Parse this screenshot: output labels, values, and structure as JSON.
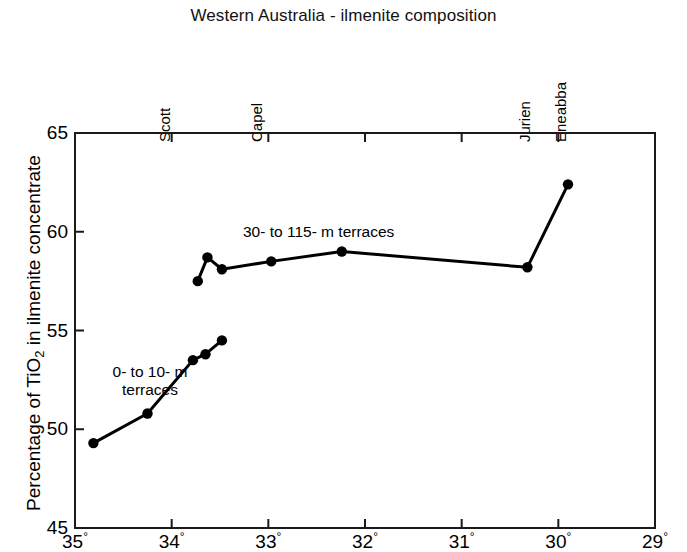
{
  "chart_data": {
    "type": "line",
    "title": "Western Australia - ilmenite composition",
    "xlabel": "",
    "ylabel": "Percentage of TiO2 in ilmenite concentrate",
    "ylabel_parts": {
      "pre": "Percentage of TiO",
      "sub": "2",
      "post": " in ilmenite concentrate"
    },
    "xlim": [
      35,
      29
    ],
    "ylim": [
      45,
      65
    ],
    "xticks": [
      35,
      34,
      33,
      32,
      31,
      30,
      29
    ],
    "xtick_labels": [
      "35°",
      "34°",
      "33°",
      "32°",
      "31°",
      "30°",
      "29°"
    ],
    "yticks": [
      45,
      50,
      55,
      60,
      65
    ],
    "ytick_labels": [
      "45",
      "50",
      "55",
      "60",
      "65"
    ],
    "grid": false,
    "legend": "none",
    "axis_direction_note": "x decreases left to right (degrees south latitude)",
    "locality_labels": [
      {
        "name": "Scott",
        "x": 34.05
      },
      {
        "name": "Capel",
        "x": 33.1
      },
      {
        "name": "Jurien",
        "x": 30.32
      },
      {
        "name": "Eneabba",
        "x": 29.95
      }
    ],
    "series": [
      {
        "name": "30- to 115- m terraces",
        "annotation": "30- to 115- m terraces",
        "color": "#000000",
        "points": [
          {
            "x": 33.73,
            "y": 57.5
          },
          {
            "x": 33.63,
            "y": 58.7
          },
          {
            "x": 33.48,
            "y": 58.1
          },
          {
            "x": 32.97,
            "y": 58.5
          },
          {
            "x": 32.24,
            "y": 59.0
          },
          {
            "x": 30.32,
            "y": 58.2
          },
          {
            "x": 29.9,
            "y": 62.4
          }
        ]
      },
      {
        "name": "0- to 10- m terraces",
        "annotation_line1": "0- to 10- m",
        "annotation_line2": "terraces",
        "color": "#000000",
        "points": [
          {
            "x": 34.81,
            "y": 49.3
          },
          {
            "x": 34.25,
            "y": 50.8
          },
          {
            "x": 33.78,
            "y": 53.5
          },
          {
            "x": 33.65,
            "y": 53.8
          },
          {
            "x": 33.48,
            "y": 54.5
          }
        ]
      }
    ]
  }
}
